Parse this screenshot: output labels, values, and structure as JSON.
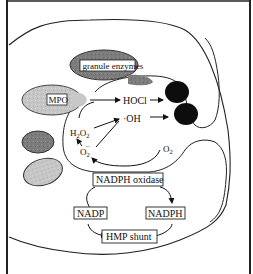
{
  "diagram": {
    "nodes": {
      "granule_enzymes": "granule enzymes",
      "mpo": "MPO",
      "hocl": "HOCl",
      "oh": "·OH",
      "h2o2": {
        "base": "H",
        "sub1": "2",
        "mid": "O",
        "sub2": "2"
      },
      "o2_superoxide": {
        "base": "O",
        "sub": "2",
        "sup": "–"
      },
      "o2": {
        "base": "O",
        "sub": "2"
      },
      "nadph_oxidase": "NADPH oxidase",
      "nadp": "NADP",
      "nadph": "NADPH",
      "hmp_shunt": "HMP shunt"
    },
    "edges": [
      {
        "from": "MPO",
        "to": "HOCl"
      },
      {
        "from": "H2O2",
        "to": "HOCl"
      },
      {
        "from": "HOCl",
        "to": "microbe-1"
      },
      {
        "from": "·OH",
        "to": "microbe-2"
      },
      {
        "from": "H2O2",
        "to": "·OH"
      },
      {
        "from": "O2-",
        "to": "·OH"
      },
      {
        "from": "O2-",
        "to": "H2O2"
      },
      {
        "from": "O2",
        "to": "O2-",
        "via": "NADPH oxidase"
      },
      {
        "from": "NADPH",
        "to": "NADP",
        "via": "NADPH oxidase"
      },
      {
        "from": "NADP",
        "to": "NADPH",
        "via": "HMP shunt"
      }
    ],
    "colors": {
      "granule_fill": "#7a7a7a",
      "mpo_fill": "#c8c8c8",
      "microbe_fill": "#0d0d0d",
      "dark_granule_fill": "#6e6e6e",
      "light_granule_fill": "#c4c4c4",
      "line": "#222222"
    }
  }
}
